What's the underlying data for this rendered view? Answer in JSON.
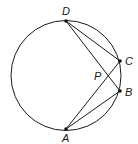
{
  "figure": {
    "type": "circle-geometry",
    "stroke_color": "#1a1a1a",
    "background": "#ffffff",
    "circle": {
      "cx": 66,
      "cy": 75.5,
      "r": 55
    },
    "points": [
      {
        "id": "D",
        "label": "D",
        "x": 66,
        "y": 21,
        "label_x": 62,
        "label_y": 15
      },
      {
        "id": "C",
        "label": "C",
        "x": 120,
        "y": 61,
        "label_x": 125,
        "label_y": 65
      },
      {
        "id": "B",
        "label": "B",
        "x": 120,
        "y": 91,
        "label_x": 125,
        "label_y": 96
      },
      {
        "id": "A",
        "label": "A",
        "x": 66,
        "y": 129,
        "label_x": 62,
        "label_y": 142
      }
    ],
    "intersection": {
      "id": "P",
      "label": "P",
      "x": 107,
      "y": 76,
      "label_x": 94,
      "label_y": 80
    },
    "segments": [
      {
        "from": "D",
        "to": "C"
      },
      {
        "from": "D",
        "to": "B"
      },
      {
        "from": "A",
        "to": "C"
      },
      {
        "from": "A",
        "to": "B"
      }
    ]
  }
}
